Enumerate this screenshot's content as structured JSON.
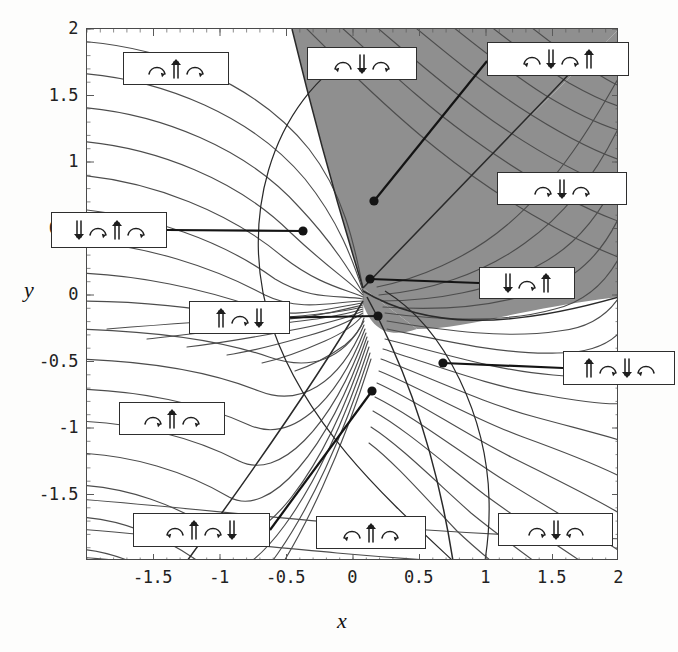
{
  "figure": {
    "kind": "contour-plot-with-region-labels",
    "background": "#ffffff",
    "shaded_fill": "#8f8f8f",
    "contour_color": "#4d4d4d",
    "frame_color": "#4a4a4a"
  },
  "axes": {
    "x_label": "x",
    "y_label": "y",
    "x_ticks": [
      "-1.5",
      "-1",
      "-0.5",
      "0",
      "0.5",
      "1",
      "1.5",
      "2"
    ],
    "x_tick_values": [
      -1.5,
      -1,
      -0.5,
      0,
      0.5,
      1,
      1.5,
      2
    ],
    "y_ticks": [
      "2",
      "1.5",
      "1",
      "0.5",
      "0",
      "-0.5",
      "-1",
      "-1.5"
    ],
    "y_tick_values": [
      2,
      1.5,
      1,
      0.5,
      0,
      -0.5,
      -1,
      -1.5
    ],
    "xlim": [
      -2,
      2
    ],
    "ylim": [
      -2,
      2
    ]
  },
  "chart_data": {
    "type": "contour",
    "title": "",
    "xlabel": "x",
    "ylabel": "y",
    "xlim": [
      -2,
      2
    ],
    "ylim": [
      -2,
      2
    ],
    "grid": false,
    "legend": "none",
    "contour_count": 26,
    "shaded_regions": 1,
    "annotation_count": 12,
    "annotations": [
      {
        "id": "a1",
        "symbols": [
          "arc-right",
          "up-double",
          "arc-right"
        ],
        "box": {
          "x": 123,
          "y": 52,
          "w": 106,
          "h": 33
        },
        "leader": false
      },
      {
        "id": "a2",
        "symbols": [
          "arc-left",
          "down-double",
          "arc-right"
        ],
        "box": {
          "x": 307,
          "y": 47,
          "w": 110,
          "h": 33
        },
        "leader": false
      },
      {
        "id": "a3",
        "symbols": [
          "arc-left",
          "down-double",
          "arc-right",
          "up-double"
        ],
        "box": {
          "x": 487,
          "y": 42,
          "w": 142,
          "h": 34
        },
        "leader": true,
        "anchor": {
          "x": 374,
          "y": 201
        }
      },
      {
        "id": "a4",
        "symbols": [
          "arc-right",
          "down-double",
          "arc-right"
        ],
        "box": {
          "x": 497,
          "y": 172,
          "w": 130,
          "h": 33
        },
        "leader": false
      },
      {
        "id": "a5",
        "symbols": [
          "down-double",
          "arc-right",
          "up-double",
          "arc-right"
        ],
        "box": {
          "x": 51,
          "y": 212,
          "w": 116,
          "h": 36
        },
        "leader": true,
        "anchor": {
          "x": 303,
          "y": 231
        }
      },
      {
        "id": "a6",
        "symbols": [
          "down-double",
          "arc-right",
          "up-double"
        ],
        "box": {
          "x": 479,
          "y": 267,
          "w": 96,
          "h": 32
        },
        "leader": true,
        "anchor": {
          "x": 370,
          "y": 279
        }
      },
      {
        "id": "a7",
        "symbols": [
          "up-double",
          "arc-right",
          "down-double"
        ],
        "box": {
          "x": 189,
          "y": 301,
          "w": 101,
          "h": 33
        },
        "leader": true,
        "anchor": {
          "x": 378,
          "y": 316
        }
      },
      {
        "id": "a8",
        "symbols": [
          "up-double",
          "arc-right",
          "down-double",
          "arc-left"
        ],
        "box": {
          "x": 563,
          "y": 351,
          "w": 112,
          "h": 34
        },
        "leader": true,
        "anchor": {
          "x": 443,
          "y": 363
        }
      },
      {
        "id": "a9",
        "symbols": [
          "arc-right",
          "up-double",
          "arc-right"
        ],
        "box": {
          "x": 119,
          "y": 402,
          "w": 106,
          "h": 33
        },
        "leader": false
      },
      {
        "id": "a10",
        "symbols": [
          "arc-left",
          "up-double",
          "arc-right",
          "down-double"
        ],
        "box": {
          "x": 133,
          "y": 513,
          "w": 137,
          "h": 34
        },
        "leader": true,
        "anchor": {
          "x": 372,
          "y": 391
        }
      },
      {
        "id": "a11",
        "symbols": [
          "arc-left",
          "up-double",
          "arc-right"
        ],
        "box": {
          "x": 316,
          "y": 516,
          "w": 110,
          "h": 33
        },
        "leader": false
      },
      {
        "id": "a12",
        "symbols": [
          "arc-right",
          "down-double",
          "arc-left"
        ],
        "box": {
          "x": 498,
          "y": 513,
          "w": 115,
          "h": 33
        },
        "leader": false
      }
    ],
    "marker_points": [
      {
        "x": 374,
        "y": 201
      },
      {
        "x": 303,
        "y": 231
      },
      {
        "x": 370,
        "y": 279
      },
      {
        "x": 378,
        "y": 316
      },
      {
        "x": 443,
        "y": 363
      },
      {
        "x": 372,
        "y": 391
      }
    ]
  },
  "icons": {
    "arc-right": "arc-arrow-right-icon",
    "arc-left": "arc-arrow-left-icon",
    "up-double": "double-up-arrow-icon",
    "down-double": "double-down-arrow-icon"
  }
}
